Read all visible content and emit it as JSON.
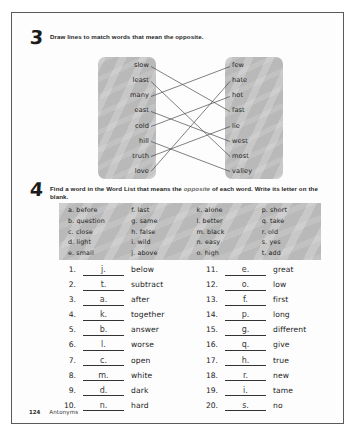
{
  "page": {
    "footer_number": "124",
    "footer_label": "Antonyms"
  },
  "exercise3": {
    "number": "3",
    "instruction": "Draw lines to match words that mean the opposite.",
    "left_words": [
      "slow",
      "least",
      "many",
      "east",
      "cold",
      "hill",
      "truth",
      "love"
    ],
    "right_words": [
      "few",
      "hate",
      "hot",
      "fast",
      "lie",
      "west",
      "most",
      "valley"
    ],
    "matches": [
      {
        "left": "slow",
        "right": "fast"
      },
      {
        "left": "least",
        "right": "most"
      },
      {
        "left": "many",
        "right": "few"
      },
      {
        "left": "east",
        "right": "west"
      },
      {
        "left": "cold",
        "right": "hot"
      },
      {
        "left": "hill",
        "right": "valley"
      },
      {
        "left": "truth",
        "right": "lie"
      },
      {
        "left": "love",
        "right": "hate"
      }
    ]
  },
  "exercise4": {
    "number": "4",
    "instruction_part1": "Find a word in the Word List that means the ",
    "instruction_italic": "opposite",
    "instruction_part2": " of each word. Write its letter on the blank.",
    "word_list": {
      "col1": [
        "a. before",
        "b. question",
        "c. close",
        "d. light",
        "e. small"
      ],
      "col2": [
        "f. last",
        "g. same",
        "h. false",
        "i. wild",
        "j. above"
      ],
      "col3": [
        "k. alone",
        "l. better",
        "m. black",
        "n. easy",
        "o. high"
      ],
      "col4": [
        "p. short",
        "q. take",
        "r. old",
        "s. yes",
        "t. add"
      ]
    },
    "answers_left": [
      {
        "num": "1.",
        "letter": "j.",
        "word": "below"
      },
      {
        "num": "2.",
        "letter": "t.",
        "word": "subtract"
      },
      {
        "num": "3.",
        "letter": "a.",
        "word": "after"
      },
      {
        "num": "4.",
        "letter": "k.",
        "word": "together"
      },
      {
        "num": "5.",
        "letter": "b.",
        "word": "answer"
      },
      {
        "num": "6.",
        "letter": "l.",
        "word": "worse"
      },
      {
        "num": "7.",
        "letter": "c.",
        "word": "open"
      },
      {
        "num": "8.",
        "letter": "m.",
        "word": "white"
      },
      {
        "num": "9.",
        "letter": "d.",
        "word": "dark"
      },
      {
        "num": "10.",
        "letter": "n.",
        "word": "hard"
      }
    ],
    "answers_right": [
      {
        "num": "11.",
        "letter": "e.",
        "word": "great"
      },
      {
        "num": "12.",
        "letter": "o.",
        "word": "low"
      },
      {
        "num": "13.",
        "letter": "f.",
        "word": "first"
      },
      {
        "num": "14.",
        "letter": "p.",
        "word": "long"
      },
      {
        "num": "15.",
        "letter": "g.",
        "word": "different"
      },
      {
        "num": "16.",
        "letter": "q.",
        "word": "give"
      },
      {
        "num": "17.",
        "letter": "h.",
        "word": "true"
      },
      {
        "num": "18.",
        "letter": "r.",
        "word": "new"
      },
      {
        "num": "19.",
        "letter": "i.",
        "word": "tame"
      },
      {
        "num": "20.",
        "letter": "s.",
        "word": "no"
      }
    ]
  }
}
